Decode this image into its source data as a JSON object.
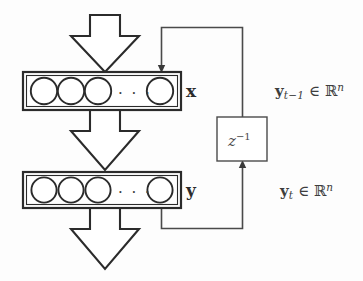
{
  "figure": {
    "type": "block-diagram",
    "background_color": "#fdfdfd",
    "stroke_color": "#2b2b2b",
    "line_color": "#4a4a4a"
  },
  "layers": [
    {
      "id": "input-layer",
      "label": "x",
      "neuron_count_visible": 4,
      "ellipsis": "· · ·",
      "box": {
        "x": 23,
        "y": 72,
        "w": 158,
        "h": 38
      }
    },
    {
      "id": "output-layer",
      "label": "y",
      "neuron_count_visible": 4,
      "ellipsis": "· · ·",
      "box": {
        "x": 23,
        "y": 172,
        "w": 158,
        "h": 36
      }
    }
  ],
  "delay_block": {
    "id": "unit-delay",
    "label_base": "z",
    "label_exponent": "−1",
    "box": {
      "x": 217,
      "y": 117,
      "w": 50,
      "h": 44
    }
  },
  "signals": [
    {
      "id": "feedback-prev",
      "bold_symbol": "y",
      "subscript": "t−1",
      "relation": "∈",
      "space": "ℝ",
      "superscript": "n",
      "full_text": "y_{t-1} ∈ ℝ^n"
    },
    {
      "id": "feedback-current",
      "bold_symbol": "y",
      "subscript": "t",
      "relation": "∈",
      "space": "ℝ",
      "superscript": "n",
      "full_text": "y_t ∈ ℝ^n"
    }
  ],
  "block_arrows": [
    {
      "id": "input-arrow",
      "direction": "down",
      "from": "external-input",
      "to": "input-layer"
    },
    {
      "id": "middle-arrow",
      "direction": "down",
      "from": "input-layer",
      "to": "output-layer"
    },
    {
      "id": "output-arrow",
      "direction": "down",
      "from": "output-layer",
      "to": "external-output"
    }
  ],
  "connections": [
    {
      "id": "delay-to-input",
      "direction": "down",
      "target": "input-layer"
    },
    {
      "id": "output-to-delay",
      "direction": "up",
      "target": "unit-delay"
    }
  ]
}
